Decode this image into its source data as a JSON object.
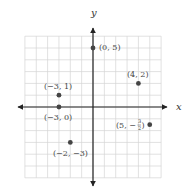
{
  "chart_data": {
    "type": "scatter",
    "title": "",
    "xlabel": "x",
    "ylabel": "y",
    "xlim": [
      -6,
      6
    ],
    "ylim": [
      -6,
      6
    ],
    "grid": true,
    "points": [
      {
        "x": 0,
        "y": 5,
        "label": "(0, 5)",
        "label_pos": "right"
      },
      {
        "x": 4,
        "y": 2,
        "label": "(4, 2)",
        "label_pos": "above"
      },
      {
        "x": -3,
        "y": 1,
        "label": "(−3, 1)",
        "label_pos": "above"
      },
      {
        "x": -3,
        "y": 0,
        "label": "(−3, 0)",
        "label_pos": "below"
      },
      {
        "x": 5,
        "y": -1.5,
        "label": "(5, −3/2)",
        "label_pos": "left"
      },
      {
        "x": -2,
        "y": -3,
        "label": "(−2, −3)",
        "label_pos": "below"
      }
    ]
  },
  "labels": {
    "x_axis": "x",
    "y_axis": "y",
    "p0": "(0, 5)",
    "p1": "(4, 2)",
    "p2": "(−3, 1)",
    "p3": "(−3, 0)",
    "p4_prefix": "(5, −",
    "p4_num": "3",
    "p4_den": "2",
    "p4_suffix": ")",
    "p5": "(−2, −3)"
  },
  "colors": {
    "grid": "#d4d4d4",
    "axis": "#222222",
    "point": "#444444",
    "text": "#444444"
  }
}
